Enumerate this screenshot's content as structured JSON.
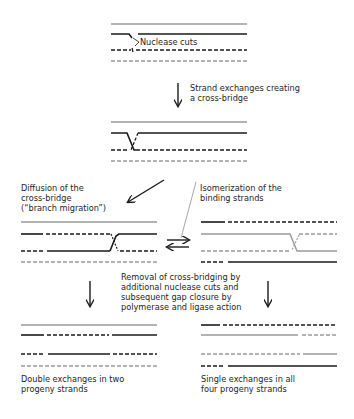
{
  "colors": {
    "black_strand": "#1a1a1a",
    "gray_strand": "#9a9a9a",
    "text": "#1e1e1e",
    "background": "#ffffff"
  },
  "labels": {
    "nuclease_cuts": "Nuclease cuts",
    "strand_exchange": [
      "Strand exchanges creating",
      "a cross-bridge"
    ],
    "diffusion": [
      "Diffusion of the",
      "cross-bridge",
      "(“branch migration”)"
    ],
    "isomerization": [
      "Isomerization of the",
      "binding strands"
    ],
    "removal": [
      "Removal of cross-bridging by",
      "additional nuclease cuts and",
      "subsequent gap closure by",
      "polymerase and ligase action"
    ],
    "double_exchange": [
      "Double exchanges in two",
      "progeny strands"
    ],
    "single_exchange": [
      "Single exchanges in all",
      "four progeny  strands"
    ]
  },
  "stages": [
    {
      "name": "initial-duplexes",
      "strands": [
        "gray-solid",
        "black-solid-cut",
        "black-dashed-cut",
        "gray-dashed"
      ]
    },
    {
      "name": "cross-bridge",
      "strands": [
        "gray-solid",
        "black-solid",
        "black-dashed",
        "gray-dashed"
      ]
    },
    {
      "name": "branch-migration",
      "strands": [
        "gray-solid",
        "black-solid/dashed",
        "black-dashed/solid",
        "gray-dashed"
      ]
    },
    {
      "name": "isomerized",
      "strands": [
        "black-solid/dashed",
        "gray-solid/dashed",
        "gray-dashed/solid",
        "black-dashed/solid"
      ]
    },
    {
      "name": "double-exchange-products",
      "strands": [
        "gray-solid",
        "black-solid/dashed/solid",
        "black-dashed/solid/dashed",
        "gray-dashed"
      ]
    },
    {
      "name": "single-exchange-products",
      "strands": [
        "black-solid/dashed",
        "gray-solid/dashed",
        "gray-dashed/solid",
        "black-dashed/solid"
      ]
    }
  ],
  "icons": {
    "arrow_down": "down-arrow",
    "arrow_diag": "diagonal-arrow",
    "equilibrium": "equilibrium-arrows"
  }
}
